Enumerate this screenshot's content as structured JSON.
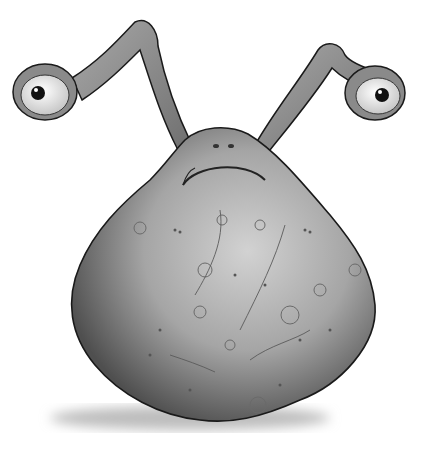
{
  "image": {
    "subject": "cartoon alien creature illustration",
    "description": "Grayscale drawing of a blob-shaped alien with a cratered, bumpy round body and two long eye-stalks ending in eyeballs, with a frowning mouth",
    "colors": {
      "background": "#ffffff",
      "body_light": "#c9c9c9",
      "body_mid": "#9a9a9a",
      "body_dark": "#555555",
      "outline": "#1a1a1a",
      "shadow": "#bdbdbd",
      "eye_white": "#f4f4f4",
      "pupil": "#111111"
    }
  }
}
